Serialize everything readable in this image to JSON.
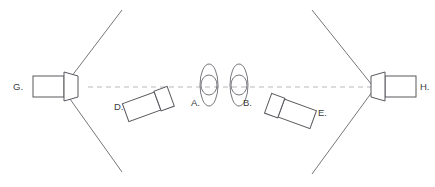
{
  "diagram": {
    "background_color": "#ffffff",
    "line_color": "#6b6b72",
    "axis_color": "#b9b9bf",
    "label_color": "#3b3b40",
    "width": 435,
    "height": 187,
    "optical_axis": {
      "name": "optical-axis",
      "style": "dashed",
      "y": 87,
      "x_start": 88,
      "x_end": 372
    },
    "labels": {
      "a": "A.",
      "b": "B.",
      "d": "D.",
      "e": "E.",
      "g": "G.",
      "h": "H."
    },
    "components": [
      {
        "id": "g",
        "label": "G.",
        "type": "camera",
        "orientation": "facing-right",
        "rotation_deg": 0,
        "x": 33,
        "y": 87
      },
      {
        "id": "h",
        "label": "H.",
        "type": "camera",
        "orientation": "facing-left",
        "rotation_deg": 0,
        "x": 399,
        "y": 87
      },
      {
        "id": "d",
        "label": "D.",
        "type": "camera",
        "orientation": "facing-up-right",
        "rotation_deg": -20,
        "x": 148,
        "y": 104
      },
      {
        "id": "e",
        "label": "E.",
        "type": "camera",
        "orientation": "facing-up-left",
        "rotation_deg": 20,
        "x": 288,
        "y": 110
      },
      {
        "id": "a",
        "label": "A.",
        "type": "lens-element",
        "orientation": "vertical",
        "x": 209,
        "y": 85
      },
      {
        "id": "b",
        "label": "B.",
        "type": "lens-element",
        "orientation": "vertical",
        "x": 239,
        "y": 85
      }
    ],
    "field_of_view_lines": [
      {
        "name": "fov-g-upper",
        "from": [
          65,
          85
        ],
        "to": [
          122,
          10
        ]
      },
      {
        "name": "fov-g-lower",
        "from": [
          65,
          92
        ],
        "to": [
          122,
          172
        ]
      },
      {
        "name": "fov-h-upper",
        "from": [
          372,
          85
        ],
        "to": [
          312,
          10
        ]
      },
      {
        "name": "fov-h-lower",
        "from": [
          372,
          92
        ],
        "to": [
          312,
          174
        ]
      }
    ]
  }
}
